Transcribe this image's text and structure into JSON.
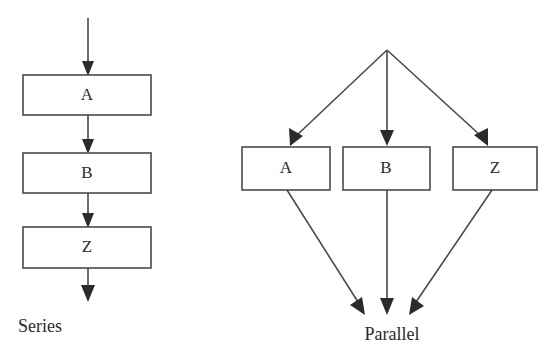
{
  "diagram": {
    "title_visible": false,
    "background_color": "#ffffff",
    "line_color": "#4a4a4a",
    "arrowhead_color": "#2b2b2b",
    "text_color": "#2b2b2b",
    "panels": [
      {
        "id": "series",
        "caption": "Series",
        "caption_position": "bottom-left",
        "nodes": [
          {
            "id": "series-a",
            "label": "A"
          },
          {
            "id": "series-b",
            "label": "B"
          },
          {
            "id": "series-z",
            "label": "Z"
          }
        ],
        "edges": [
          {
            "from": "input",
            "to": "series-a"
          },
          {
            "from": "series-a",
            "to": "series-b"
          },
          {
            "from": "series-b",
            "to": "series-z"
          },
          {
            "from": "series-z",
            "to": "output"
          }
        ]
      },
      {
        "id": "parallel",
        "caption": "Parallel",
        "caption_position": "bottom-center",
        "nodes": [
          {
            "id": "parallel-a",
            "label": "A"
          },
          {
            "id": "parallel-b",
            "label": "B"
          },
          {
            "id": "parallel-z",
            "label": "Z"
          }
        ],
        "edges": [
          {
            "from": "split",
            "to": "parallel-a"
          },
          {
            "from": "split",
            "to": "parallel-b"
          },
          {
            "from": "split",
            "to": "parallel-z"
          },
          {
            "from": "parallel-a",
            "to": "join"
          },
          {
            "from": "parallel-b",
            "to": "join"
          },
          {
            "from": "parallel-z",
            "to": "join"
          }
        ]
      }
    ]
  }
}
